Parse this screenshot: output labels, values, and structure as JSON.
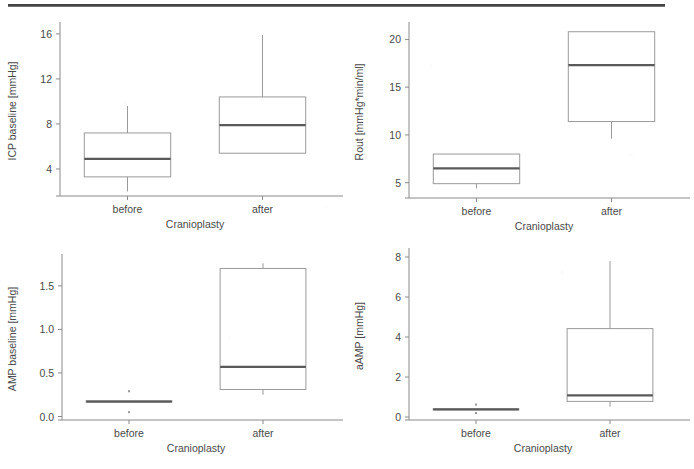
{
  "figure": {
    "artifact": "scan-line-top",
    "background": "#ffffff",
    "box_line_color": "#9a9a9a",
    "median_line_color": "#5a5a5a",
    "axis_color": "#8a8a8a",
    "text_color": "#4a4a4a"
  },
  "chart_data": [
    {
      "id": "icp-baseline",
      "panel": "top-left",
      "type": "box",
      "title": "",
      "xlabel": "Cranioplasty",
      "ylabel": "ICP baseline [mmHg]",
      "categories": [
        "before",
        "after"
      ],
      "yticks": [
        4,
        8,
        12,
        16
      ],
      "ytick_labels": [
        "4",
        "8",
        "12",
        "16"
      ],
      "ylim": [
        1.6,
        16.7
      ],
      "grid": false,
      "legend": "none",
      "boxes": [
        {
          "category": "before",
          "whisker_low": 2.0,
          "q1": 3.3,
          "median": 4.9,
          "q3": 7.2,
          "whisker_high": 9.6,
          "outliers": []
        },
        {
          "category": "after",
          "whisker_low": 5.4,
          "q1": 5.4,
          "median": 7.9,
          "q3": 10.4,
          "whisker_high": 15.9,
          "outliers": []
        }
      ]
    },
    {
      "id": "rout",
      "panel": "top-right",
      "type": "box",
      "title": "",
      "xlabel": "Cranioplasty",
      "ylabel": "Rout [mmHg*min/ml]",
      "categories": [
        "before",
        "after"
      ],
      "yticks": [
        5,
        10,
        15,
        20
      ],
      "ytick_labels": [
        "5",
        "10",
        "15",
        "20"
      ],
      "ylim": [
        3.4,
        21.4
      ],
      "grid": false,
      "legend": "none",
      "boxes": [
        {
          "category": "before",
          "whisker_low": 4.4,
          "q1": 4.9,
          "median": 6.5,
          "q3": 8.0,
          "whisker_high": 8.0,
          "outliers": []
        },
        {
          "category": "after",
          "whisker_low": 9.6,
          "q1": 11.4,
          "median": 17.3,
          "q3": 20.8,
          "whisker_high": 20.8,
          "outliers": []
        }
      ]
    },
    {
      "id": "amp-baseline",
      "panel": "bottom-left",
      "type": "box",
      "title": "",
      "xlabel": "Cranioplasty",
      "ylabel": "AMP baseline [mmHg]",
      "categories": [
        "before",
        "after"
      ],
      "yticks": [
        0.0,
        0.5,
        1.0,
        1.5
      ],
      "ytick_labels": [
        "0.0",
        "0.5",
        "1.0",
        "1.5"
      ],
      "ylim": [
        -0.04,
        1.82
      ],
      "grid": false,
      "legend": "none",
      "boxes": [
        {
          "category": "before",
          "whisker_low": 0.17,
          "q1": 0.17,
          "median": 0.17,
          "q3": 0.18,
          "whisker_high": 0.18,
          "outliers": [
            0.29,
            0.05
          ]
        },
        {
          "category": "after",
          "whisker_low": 0.25,
          "q1": 0.31,
          "median": 0.57,
          "q3": 1.7,
          "whisker_high": 1.76,
          "outliers": []
        }
      ]
    },
    {
      "id": "aamp",
      "panel": "bottom-right",
      "type": "box",
      "title": "",
      "xlabel": "Cranioplasty",
      "ylabel": "aAMP [mmHg]",
      "categories": [
        "before",
        "after"
      ],
      "yticks": [
        0,
        2,
        4,
        6,
        8
      ],
      "ytick_labels": [
        "0",
        "2",
        "4",
        "6",
        "8"
      ],
      "ylim": [
        -0.15,
        8.25
      ],
      "grid": false,
      "legend": "none",
      "boxes": [
        {
          "category": "before",
          "whisker_low": 0.36,
          "q1": 0.36,
          "median": 0.38,
          "q3": 0.4,
          "whisker_high": 0.4,
          "outliers": [
            0.62,
            0.2
          ]
        },
        {
          "category": "after",
          "whisker_low": 0.52,
          "q1": 0.78,
          "median": 1.08,
          "q3": 4.42,
          "whisker_high": 7.8,
          "outliers": []
        }
      ]
    }
  ]
}
